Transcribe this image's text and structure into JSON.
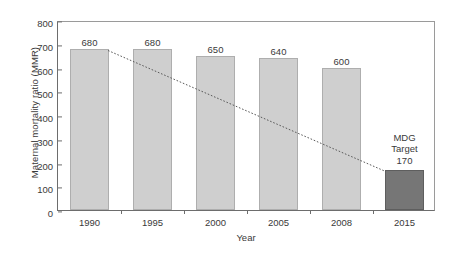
{
  "chart_data": {
    "type": "bar",
    "title": "",
    "xlabel": "Year",
    "ylabel": "Maternal mortality ratio (MMR)",
    "categories": [
      "1990",
      "1995",
      "2000",
      "2005",
      "2008",
      "2015"
    ],
    "values": [
      680,
      680,
      650,
      640,
      600,
      170
    ],
    "value_labels": [
      "680",
      "680",
      "650",
      "640",
      "600",
      "170"
    ],
    "ylim": [
      0,
      800
    ],
    "ytick_values": [
      0,
      100,
      200,
      300,
      400,
      500,
      600,
      700,
      800
    ],
    "ytick_labels": [
      "0",
      "100",
      "200",
      "300",
      "400",
      "500",
      "600",
      "700",
      "800"
    ],
    "grid": false,
    "legend": "none",
    "bar_styles": [
      "light",
      "light",
      "light",
      "light",
      "light",
      "dark"
    ],
    "colors": {
      "bar_light": "#cfcfcf",
      "bar_light_edge": "#aeaeae",
      "bar_dark": "#767676",
      "bar_dark_edge": "#5e5e5e",
      "axis": "#6d6d6d",
      "frame": "#9a9a9a",
      "text": "#3a3a3a",
      "trend_line": "#5a5a5a",
      "background": "#ffffff"
    },
    "annotations": [
      {
        "name": "mdg-target",
        "line1": "MDG",
        "line2": "Target",
        "target_category": "2015",
        "target_value": 170
      }
    ],
    "series": [
      {
        "name": "Maternal mortality ratio (MMR)",
        "values": [
          680,
          680,
          650,
          640,
          600,
          170
        ]
      },
      {
        "name": "MDG target trend line",
        "type": "line",
        "style": "dotted",
        "from": {
          "category": "1990",
          "value": 680
        },
        "to": {
          "category": "2015",
          "value": 170
        }
      }
    ]
  }
}
